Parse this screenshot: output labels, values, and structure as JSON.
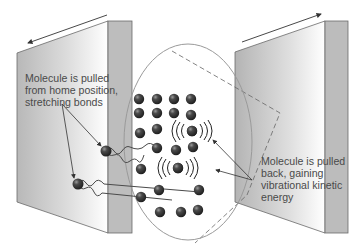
{
  "diagram": {
    "type": "physics-illustration",
    "labels": {
      "left": [
        "Molecule is pulled",
        "from home position,",
        "stretching bonds"
      ],
      "right": [
        "Molecule is pulled",
        "back, gaining",
        "vibrational kinetic",
        "energy"
      ]
    },
    "arrows": {
      "left_wall_motion": "left",
      "right_wall_motion": "right"
    },
    "colors": {
      "wall_face_dark": "#b4b4b4",
      "wall_face_light": "#ffffff",
      "wall_side": "#bdbdbd",
      "wall_edge": "#6a6a6a",
      "ellipse": "#9a9a9a",
      "molecule": "#3a3a3a",
      "text": "#4a4a4a"
    },
    "molecule_count": 32,
    "vibrating_molecules": 2
  }
}
